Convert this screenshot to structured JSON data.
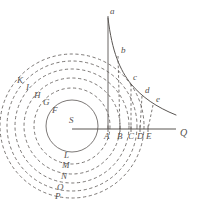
{
  "figure": {
    "name": "orbital-decay-diagram",
    "background": "#ffffff",
    "ink": "#5a5653",
    "faint_ink": "#8c8884"
  },
  "center": {
    "label": "S",
    "x": 72,
    "y": 126
  },
  "axis": {
    "name": "horizontal-axis",
    "end_label": "Q",
    "x1": 72,
    "y1": 129,
    "x2": 176,
    "y2": 129,
    "label_x": 180,
    "label_y": 136
  },
  "vertical_line": {
    "x": 108,
    "y_top": 16,
    "y_bottom": 129
  },
  "circles": [
    {
      "id": "c1",
      "r": 26,
      "dashed": false
    },
    {
      "id": "c2",
      "r": 38,
      "dashed": true
    },
    {
      "id": "c3",
      "r": 48,
      "dashed": true
    },
    {
      "id": "c4",
      "r": 57,
      "dashed": true
    },
    {
      "id": "c5",
      "r": 65,
      "dashed": true
    },
    {
      "id": "c6",
      "r": 72,
      "dashed": true
    }
  ],
  "curve": {
    "name": "decay-curve",
    "path": "M 108 18 C 112 52, 120 70, 131 84 C 142 97, 156 107, 176 115"
  },
  "axis_points": [
    {
      "label": "A",
      "x": 108,
      "lx": 104,
      "ly": 139
    },
    {
      "label": "B",
      "x": 120,
      "lx": 117,
      "ly": 139
    },
    {
      "label": "C",
      "x": 131,
      "lx": 128,
      "ly": 139
    },
    {
      "label": "D",
      "x": 140,
      "lx": 137,
      "ly": 139
    },
    {
      "label": "E",
      "x": 148,
      "lx": 146,
      "ly": 139
    }
  ],
  "curve_points": [
    {
      "label": "a",
      "x": 108,
      "y": 18,
      "lx": 110,
      "ly": 14
    },
    {
      "label": "b",
      "x": 118,
      "y": 56,
      "lx": 121,
      "ly": 53
    },
    {
      "label": "c",
      "x": 131,
      "y": 84,
      "lx": 133,
      "ly": 80
    },
    {
      "label": "d",
      "x": 142,
      "y": 96,
      "lx": 145,
      "ly": 93
    },
    {
      "label": "e",
      "x": 153,
      "y": 105,
      "lx": 156,
      "ly": 102
    }
  ],
  "chords": [
    {
      "from_x": 118,
      "from_y": 56,
      "to_x": 120,
      "to_y": 129
    },
    {
      "from_x": 131,
      "from_y": 84,
      "to_x": 131,
      "to_y": 129
    },
    {
      "from_x": 142,
      "from_y": 96,
      "to_x": 140,
      "to_y": 129
    },
    {
      "from_x": 153,
      "from_y": 105,
      "to_x": 148,
      "to_y": 129
    }
  ],
  "upper_left_labels": [
    {
      "label": "K",
      "x": 17,
      "y": 83
    },
    {
      "label": "I",
      "x": 26,
      "y": 90
    },
    {
      "label": "H",
      "x": 34,
      "y": 98
    },
    {
      "label": "G",
      "x": 43,
      "y": 105
    },
    {
      "label": "F",
      "x": 52,
      "y": 113
    }
  ],
  "lower_labels": [
    {
      "label": "L",
      "x": 64,
      "y": 158
    },
    {
      "label": "M",
      "x": 62,
      "y": 168
    },
    {
      "label": "N",
      "x": 61,
      "y": 179
    },
    {
      "label": "O",
      "x": 57,
      "y": 190
    },
    {
      "label": "P",
      "x": 55,
      "y": 199
    }
  ]
}
